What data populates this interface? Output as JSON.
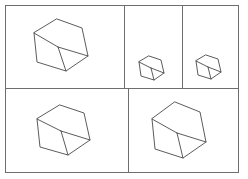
{
  "figure": {
    "background_color": "#ffffff",
    "frame_color": "#6e6e6e",
    "line_color": "#4a4a4a",
    "width": 248,
    "height": 179
  },
  "layout": {
    "outer_frame": {
      "x": 5,
      "y": 5,
      "width": 233,
      "height": 167
    },
    "dividers": [
      {
        "name": "top-row-divider-1",
        "orientation": "vertical",
        "x": 124,
        "y1": 5,
        "y2": 88
      },
      {
        "name": "top-row-divider-2",
        "orientation": "vertical",
        "x": 182,
        "y1": 5,
        "y2": 88
      },
      {
        "name": "row-divider",
        "orientation": "horizontal",
        "y": 88,
        "x1": 5,
        "x2": 238
      },
      {
        "name": "bottom-row-divider",
        "orientation": "vertical",
        "x": 128,
        "y1": 88,
        "y2": 172
      }
    ]
  },
  "panels": [
    {
      "id": "panel-top-left",
      "label": "top-left",
      "rect": {
        "x": 5,
        "y": 5,
        "width": 119,
        "height": 83
      },
      "shape": {
        "name": "wireframe-cube",
        "type": "isometric-cube",
        "scale": "large",
        "center": {
          "x": 59,
          "y": 45
        },
        "vertices": {
          "top": {
            "x": 57,
            "y": 19
          },
          "upper_right": {
            "x": 82,
            "y": 28
          },
          "lower_right": {
            "x": 88,
            "y": 56
          },
          "bottom": {
            "x": 66,
            "y": 71
          },
          "lower_left": {
            "x": 37,
            "y": 62
          },
          "upper_left": {
            "x": 34,
            "y": 33
          },
          "center": {
            "x": 58,
            "y": 47
          }
        }
      }
    },
    {
      "id": "panel-top-middle",
      "label": "top-middle",
      "rect": {
        "x": 124,
        "y": 5,
        "width": 58,
        "height": 83
      },
      "shape": {
        "name": "wireframe-cube",
        "type": "isometric-cube",
        "scale": "small",
        "center": {
          "x": 152,
          "y": 67
        },
        "vertices": {
          "top": {
            "x": 149,
            "y": 56
          },
          "upper_right": {
            "x": 161,
            "y": 60
          },
          "lower_right": {
            "x": 164,
            "y": 73
          },
          "bottom": {
            "x": 154,
            "y": 80
          },
          "lower_left": {
            "x": 141,
            "y": 76
          },
          "upper_left": {
            "x": 139,
            "y": 62
          },
          "center": {
            "x": 151,
            "y": 68
          }
        }
      }
    },
    {
      "id": "panel-top-right",
      "label": "top-right",
      "rect": {
        "x": 182,
        "y": 5,
        "width": 56,
        "height": 83
      },
      "shape": {
        "name": "wireframe-cube",
        "type": "isometric-cube",
        "scale": "small",
        "center": {
          "x": 209,
          "y": 66
        },
        "vertices": {
          "top": {
            "x": 206,
            "y": 55
          },
          "upper_right": {
            "x": 218,
            "y": 59
          },
          "lower_right": {
            "x": 221,
            "y": 72
          },
          "bottom": {
            "x": 211,
            "y": 79
          },
          "lower_left": {
            "x": 198,
            "y": 75
          },
          "upper_left": {
            "x": 196,
            "y": 61
          },
          "center": {
            "x": 208,
            "y": 67
          }
        }
      }
    },
    {
      "id": "panel-bottom-left",
      "label": "bottom-left",
      "rect": {
        "x": 5,
        "y": 88,
        "width": 123,
        "height": 84
      },
      "shape": {
        "name": "wireframe-cube",
        "type": "isometric-cube",
        "scale": "large",
        "center": {
          "x": 62,
          "y": 130
        },
        "vertices": {
          "top": {
            "x": 60,
            "y": 105
          },
          "upper_right": {
            "x": 84,
            "y": 113
          },
          "lower_right": {
            "x": 90,
            "y": 140
          },
          "bottom": {
            "x": 68,
            "y": 155
          },
          "lower_left": {
            "x": 40,
            "y": 147
          },
          "upper_left": {
            "x": 37,
            "y": 119
          },
          "center": {
            "x": 61,
            "y": 131
          }
        }
      }
    },
    {
      "id": "panel-bottom-right",
      "label": "bottom-right",
      "rect": {
        "x": 128,
        "y": 88,
        "width": 110,
        "height": 84
      },
      "shape": {
        "name": "wireframe-cube",
        "type": "isometric-cube",
        "scale": "large",
        "center": {
          "x": 178,
          "y": 131
        },
        "vertices": {
          "top": {
            "x": 175,
            "y": 102
          },
          "upper_right": {
            "x": 200,
            "y": 112
          },
          "lower_right": {
            "x": 206,
            "y": 142
          },
          "bottom": {
            "x": 183,
            "y": 158
          },
          "lower_left": {
            "x": 155,
            "y": 149
          },
          "upper_left": {
            "x": 152,
            "y": 119
          },
          "center": {
            "x": 177,
            "y": 133
          }
        }
      }
    }
  ]
}
